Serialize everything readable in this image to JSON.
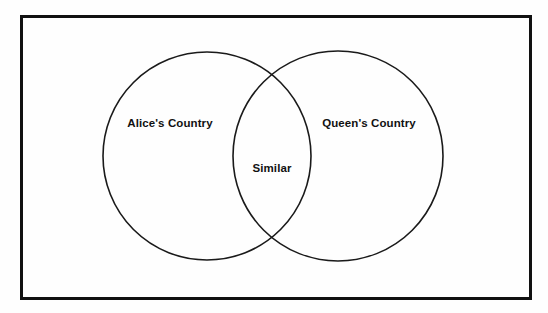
{
  "diagram": {
    "type": "venn",
    "title": "",
    "background_color": "#fefefe",
    "border": {
      "name": "outer-frame",
      "color": "#111111",
      "thickness_px": 3,
      "x": 20,
      "y": 15,
      "width": 512,
      "height": 285
    },
    "stroke_color": "#1a1a1a",
    "stroke_width_px": 1.6,
    "sets": [
      {
        "id": "left",
        "label": "Alice's Country",
        "cx": 207,
        "cy": 156,
        "r": 104,
        "label_x": 170,
        "label_y": 124
      },
      {
        "id": "right",
        "label": "Queen's Country",
        "cx": 338,
        "cy": 156,
        "r": 105,
        "label_x": 369,
        "label_y": 124
      }
    ],
    "intersection": {
      "id": "overlap",
      "label": "Similar",
      "label_x": 272,
      "label_y": 169
    }
  }
}
